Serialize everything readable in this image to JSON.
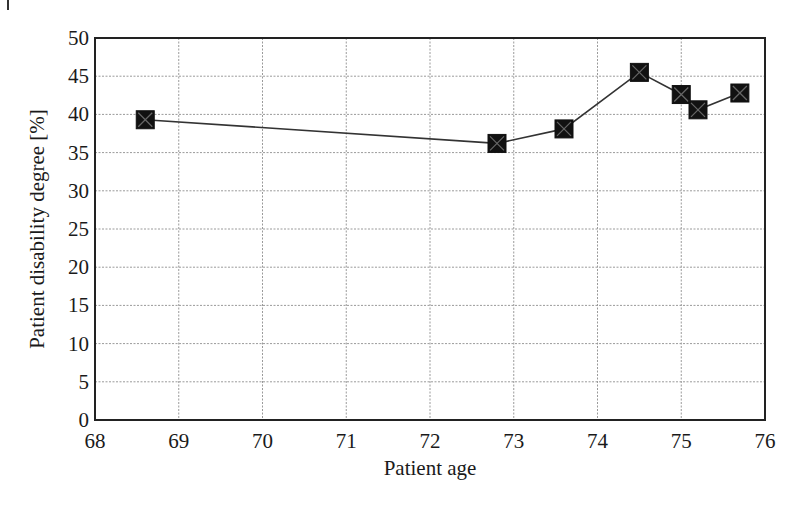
{
  "chart_data": {
    "type": "line",
    "title": "",
    "xlabel": "Patient age",
    "ylabel": "Patient disability degree [%]",
    "xlim": [
      68,
      76
    ],
    "ylim": [
      0,
      50
    ],
    "xticks": [
      68,
      69,
      70,
      71,
      72,
      73,
      74,
      75,
      76
    ],
    "yticks": [
      0,
      5,
      10,
      15,
      20,
      25,
      30,
      35,
      40,
      45,
      50
    ],
    "grid": true,
    "legend": null,
    "marker": "square-with-x",
    "series": [
      {
        "name": "Patient disability degree",
        "color": "#111111",
        "x": [
          68.6,
          72.8,
          73.6,
          74.5,
          75.0,
          75.2,
          75.7
        ],
        "values": [
          39.3,
          36.2,
          38.1,
          45.5,
          42.6,
          40.6,
          42.8
        ]
      }
    ]
  }
}
